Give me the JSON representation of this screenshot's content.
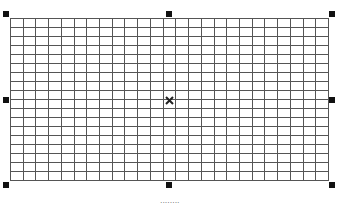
{
  "canvas": {
    "object": "table-grid",
    "selected": true,
    "rows": 18,
    "columns": 25,
    "border_color": "#555555",
    "handle_color": "#111111"
  },
  "handles": [
    {
      "id": "top-left"
    },
    {
      "id": "top-center"
    },
    {
      "id": "top-right"
    },
    {
      "id": "middle-left"
    },
    {
      "id": "middle-right"
    },
    {
      "id": "bottom-left"
    },
    {
      "id": "bottom-center"
    },
    {
      "id": "bottom-right"
    }
  ],
  "center_icon": "move-icon",
  "caption": {
    "text": "........"
  }
}
